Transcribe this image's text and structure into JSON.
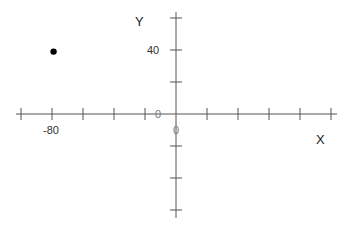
{
  "chart_data": {
    "type": "scatter",
    "title": "",
    "xlabel": "X",
    "ylabel": "Y",
    "xlim": [
      -100,
      100
    ],
    "ylim": [
      -60,
      60
    ],
    "x_tick_step": 20,
    "y_tick_step": 20,
    "x_tick_labels": [
      {
        "value": -80,
        "label": "-80"
      },
      {
        "value": 0,
        "label": "0"
      }
    ],
    "y_tick_labels": [
      {
        "value": 40,
        "label": "40"
      },
      {
        "value": 0,
        "label": "0"
      }
    ],
    "grid": false,
    "legend": null,
    "series": [
      {
        "name": "point",
        "x": [
          -79
        ],
        "y": [
          39
        ],
        "color": "#000000"
      }
    ]
  },
  "labels": {
    "x_axis": "X",
    "y_axis": "Y",
    "tick_neg80": "-80",
    "tick_40": "40",
    "origin_x": "0",
    "origin_y": "0"
  },
  "colors": {
    "axis": "#555555",
    "point": "#000000"
  }
}
